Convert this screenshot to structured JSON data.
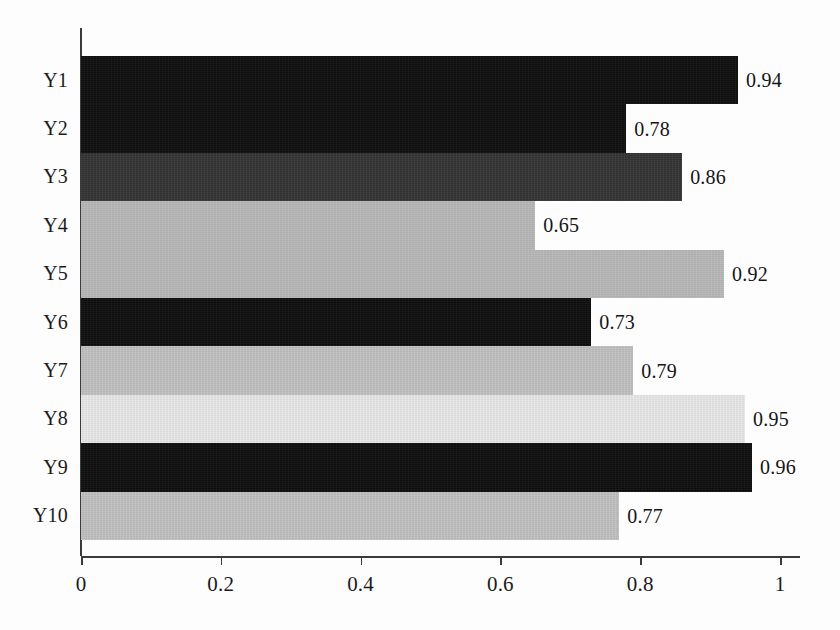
{
  "chart_data": {
    "type": "bar",
    "orientation": "horizontal",
    "title": "",
    "xlabel": "",
    "ylabel": "",
    "categories": [
      "Y1",
      "Y2",
      "Y3",
      "Y4",
      "Y5",
      "Y6",
      "Y7",
      "Y8",
      "Y9",
      "Y10"
    ],
    "values": [
      0.94,
      0.78,
      0.86,
      0.65,
      0.92,
      0.73,
      0.79,
      0.95,
      0.96,
      0.77
    ],
    "value_labels": [
      "0.94",
      "0.78",
      "0.86",
      "0.65",
      "0.92",
      "0.73",
      "0.79",
      "0.95",
      "0.96",
      "0.77"
    ],
    "bar_colors": [
      "#0d0d0d",
      "#0d0d0d",
      "#343434",
      "#b9b9b9",
      "#b9b9b9",
      "#0d0d0d",
      "#c2c2c2",
      "#e9e9e9",
      "#0d0d0d",
      "#c2c2c2"
    ],
    "xlim": [
      0,
      1
    ],
    "xticks": [
      0,
      0.2,
      0.4,
      0.6,
      0.8,
      1
    ],
    "xtick_labels": [
      "0",
      "0.2",
      "0.4",
      "0.6",
      "0.8",
      "1"
    ],
    "grid": false,
    "legend": "none",
    "bar_gap": 0,
    "axis_color": "#3a3a3a",
    "text_color": "#1b1b1b",
    "background": "#fdfdfd"
  }
}
